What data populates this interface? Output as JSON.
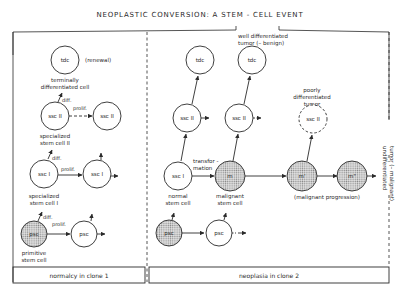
{
  "title": "NEOPLASTIC CONVERSION: A STEM - CELL EVENT",
  "panels": {
    "left": {
      "caption": "normalcy in clone 1",
      "cells": {
        "tdc": "tdc",
        "ssc2_a": "ssc II",
        "ssc2_b": "ssc II",
        "ssc1_a": "ssc I",
        "ssc1_b": "ssc I",
        "psc_a": "psc",
        "psc_b": "psc"
      },
      "labels": {
        "renewal": "(renewal)",
        "tdc_line1": "terminally",
        "tdc_line2": "differentiated cell",
        "diff_2": "diff.",
        "prolif_2": "prolif.",
        "ssc2_line1": "specialized",
        "ssc2_line2": "stem cell II",
        "diff_1": "diff.",
        "prolif_1": "prolif.",
        "ssc1_line1": "specialized",
        "ssc1_line2": "stem cell I",
        "diff_0": "diff.",
        "prolif_0": "prolif.",
        "psc_line1": "primitive",
        "psc_line2": "stem cell"
      }
    },
    "right": {
      "caption": "neoplasia in clone 2",
      "cells": {
        "tdc_a": "tdc",
        "tdc_b": "tdc",
        "ssc2_a": "ssc II",
        "ssc2_b": "ssc II",
        "ssc2_c": "ssc II",
        "ssc1": "ssc I",
        "m": "m",
        "m1": "m'",
        "m2": "m\"",
        "psc_a": "psc",
        "psc_b": "psc"
      },
      "labels": {
        "well_line1": "well differentiated",
        "well_line2": "tumor (– benign)",
        "poorly_line1": "poorly",
        "poorly_line2": "differentiated",
        "poorly_line3": "tumor",
        "transf_line1": "transfor -",
        "transf_line2": "mation",
        "normal_line1": "normal",
        "normal_line2": "stem cell",
        "malig_line1": "malignant",
        "malig_line2": "stem cell",
        "progression": "(malignant progression)",
        "undiff_line1": "undifferentiated",
        "undiff_line2": "tumor (– malignant)"
      }
    }
  },
  "colors": {
    "ink": "#2a2a2a",
    "shaded_fill": "#c9c9c9",
    "background": "#ffffff"
  }
}
